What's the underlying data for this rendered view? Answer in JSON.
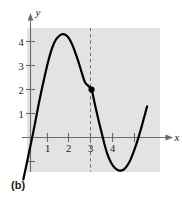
{
  "figure": {
    "caption": "(b)",
    "background_color": "#ffffff",
    "plot_area_color": "#e3e3e3"
  },
  "chart_data": {
    "type": "line",
    "title": "",
    "subtitle": "",
    "xlabel": "x",
    "ylabel": "y",
    "xlim": [
      -0.35,
      5.4
    ],
    "ylim": [
      -1.9,
      4.9
    ],
    "grid": false,
    "legend": null,
    "x_ticks": [
      1,
      2,
      3,
      4
    ],
    "x_tick_labels": [
      "1",
      "2",
      "3",
      "4"
    ],
    "y_ticks": [
      1,
      2,
      3,
      4
    ],
    "y_tick_labels": [
      "1",
      "2",
      "3",
      "4"
    ],
    "curve_color": "#000000",
    "curve_width": 2.2,
    "series": [
      {
        "name": "curve",
        "x": [
          -0.33,
          -0.2,
          -0.05,
          0.1,
          0.25,
          0.4,
          0.55,
          0.7,
          0.85,
          1.0,
          1.15,
          1.3,
          1.45,
          1.6,
          1.75,
          1.9,
          2.05,
          2.2,
          2.35,
          2.5,
          2.65,
          2.8,
          2.95,
          3.1,
          3.25,
          3.4,
          3.55,
          3.7,
          3.85,
          4.0,
          4.15,
          4.3,
          4.45,
          4.6,
          4.75,
          4.9,
          5.05,
          5.2,
          5.35
        ],
        "y": [
          -1.75,
          -1.2,
          -0.55,
          0.1,
          0.8,
          1.5,
          2.15,
          2.75,
          3.3,
          3.75,
          4.05,
          4.22,
          4.3,
          4.28,
          4.15,
          3.9,
          3.55,
          3.15,
          2.7,
          2.3,
          2.15,
          2.0,
          1.4,
          0.8,
          0.25,
          -0.3,
          -0.75,
          -1.05,
          -1.25,
          -1.35,
          -1.38,
          -1.32,
          -1.15,
          -0.9,
          -0.55,
          -0.15,
          0.3,
          0.8,
          1.3
        ]
      }
    ],
    "annotations": [
      {
        "kind": "point",
        "x": 2.8,
        "y": 2,
        "marker": "filled-circle",
        "color": "#000000"
      },
      {
        "kind": "vertical-dashed-line",
        "x": 2.8,
        "color": "#6b6b6b"
      }
    ]
  }
}
